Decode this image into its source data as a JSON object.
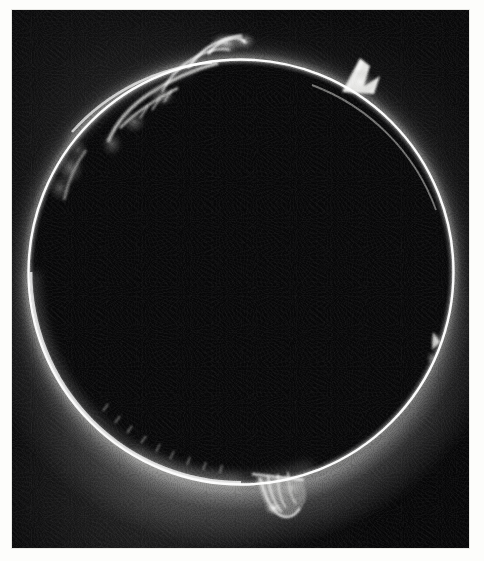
{
  "image": {
    "kind": "astronomical-photograph",
    "subject": "Solar chromosphere and prominences at total eclipse / coronagraph limb",
    "medium": "black-and-white photographic plate print",
    "border_color": "#fdfdfb",
    "sky_color": "#060607",
    "limb_color": "#ffffff",
    "corona_color": "#b6b6b4",
    "plate": {
      "x": 12,
      "y": 10,
      "width": 457,
      "height": 538
    }
  },
  "disk": {
    "label": "solar-disk",
    "center_x": 241,
    "center_y": 272,
    "radius": 212,
    "ring_thickness_px": 2.4,
    "description": "Bright thin chromospheric ring encircling an occulted dark solar disk"
  },
  "chart_data": {
    "type": "scatter",
    "xlabel": "position angle (clock position on limb)",
    "ylabel": "radial extent beyond limb (px)",
    "grid": false,
    "legend": "none",
    "xlim": [
      0,
      360
    ],
    "ylim": [
      0,
      45
    ],
    "categories": [
      "upper-left arch complex",
      "left-limb diffuse patch",
      "upper-right horn spike",
      "right-limb small patch",
      "bottom fan loop",
      "lower-left spicule band"
    ],
    "values": [
      34,
      16,
      26,
      11,
      30,
      9
    ],
    "series": [
      {
        "name": "prominence radial extent (px)",
        "values": [
          34,
          16,
          26,
          11,
          30,
          9
        ]
      },
      {
        "name": "relative brightness (0-1)",
        "values": [
          0.95,
          0.55,
          1.0,
          0.5,
          1.0,
          0.42
        ]
      }
    ],
    "x": [
      318,
      288,
      52,
      110,
      188,
      215
    ],
    "annotations": [
      "Large arching streamer complex near the 11 o'clock limb",
      "Sharp bright horn-shaped prominence near 1 o'clock",
      "Detached fan / loop prominence hanging below the 6 o'clock limb",
      "Faint coronal glow strongest toward the lower-left quadrant"
    ]
  },
  "features": [
    {
      "name": "prominence-upper-left-arch",
      "angle_deg": 318,
      "height_px": 34,
      "brightness": 0.95,
      "note": "Broad, streaming arch with filamentary legs"
    },
    {
      "name": "prominence-left-diffuse",
      "angle_deg": 288,
      "height_px": 16,
      "brightness": 0.55,
      "note": "Soft diffuse cloud clinging to the limb"
    },
    {
      "name": "prominence-upper-right-horn",
      "angle_deg": 52,
      "height_px": 26,
      "brightness": 1.0,
      "note": "Sharp pointed spike leaning away from the limb"
    },
    {
      "name": "prominence-right-small",
      "angle_deg": 110,
      "height_px": 11,
      "brightness": 0.5,
      "note": "Small bright knot on the right limb"
    },
    {
      "name": "prominence-bottom-fan",
      "angle_deg": 188,
      "height_px": 30,
      "brightness": 1.0,
      "note": "Fan of loops hanging beneath the limb, brightest feature"
    },
    {
      "name": "spicule-band-lower-left",
      "angle_deg": 215,
      "height_px": 9,
      "brightness": 0.42,
      "note": "Grassy spicule fringe along a glowing limb segment"
    }
  ]
}
